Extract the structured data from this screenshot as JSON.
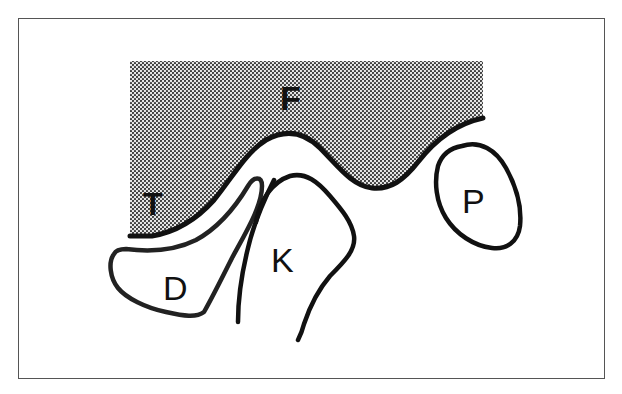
{
  "diagram": {
    "type": "schematic anatomical cross-section",
    "colors": {
      "frame": "#555555",
      "stroke": "#111111",
      "hatch_dot": "#333333",
      "background": "#ffffff"
    },
    "labels": {
      "F": "F",
      "T": "T",
      "D": "D",
      "K": "K",
      "P": "P"
    },
    "regions": [
      {
        "id": "F",
        "description": "dotted/shaded upper region"
      },
      {
        "id": "T",
        "description": "label inside shaded region, lower left"
      },
      {
        "id": "D",
        "description": "outlined lobe, lower left"
      },
      {
        "id": "K",
        "description": "outlined open structure, center"
      },
      {
        "id": "P",
        "description": "isolated oval, right"
      }
    ]
  }
}
